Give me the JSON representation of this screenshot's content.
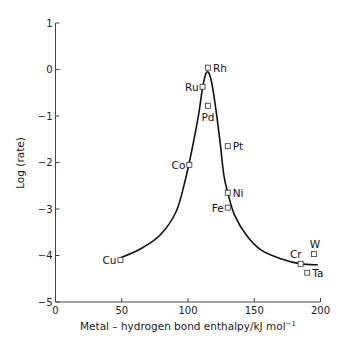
{
  "chart_data": {
    "type": "scatter",
    "title": "",
    "xlabel": "Metal – hydrogen bond enthalpy/kJ mol",
    "xlabel_superscript": "−1",
    "ylabel": "Log (rate)",
    "xlim": [
      0,
      200
    ],
    "ylim": [
      -5,
      1
    ],
    "xticks": [
      0,
      50,
      100,
      150,
      200
    ],
    "yticks": [
      1,
      0,
      -1,
      -2,
      -3,
      -4,
      -5
    ],
    "ytick_labels": [
      "1",
      "0",
      "−1",
      "−2",
      "−3",
      "−4",
      "−5"
    ],
    "grid": false,
    "legend": null,
    "points": [
      {
        "label": "Cu",
        "x": 49,
        "y": -4.1,
        "label_pos": "left"
      },
      {
        "label": "Co",
        "x": 101,
        "y": -2.05,
        "label_pos": "left"
      },
      {
        "label": "Ru",
        "x": 111,
        "y": -0.37,
        "label_pos": "left"
      },
      {
        "label": "Rh",
        "x": 115,
        "y": 0.04,
        "label_pos": "right"
      },
      {
        "label": "Pd",
        "x": 115,
        "y": -0.78,
        "label_pos": "below"
      },
      {
        "label": "Pt",
        "x": 130,
        "y": -1.65,
        "label_pos": "right"
      },
      {
        "label": "Ni",
        "x": 130,
        "y": -2.65,
        "label_pos": "right"
      },
      {
        "label": "Fe",
        "x": 130,
        "y": -2.97,
        "label_pos": "left"
      },
      {
        "label": "Cr",
        "x": 185,
        "y": -4.18,
        "label_pos": "above-left"
      },
      {
        "label": "W",
        "x": 195,
        "y": -3.97,
        "label_pos": "above"
      },
      {
        "label": "Ta",
        "x": 190,
        "y": -4.37,
        "label_pos": "right"
      }
    ],
    "curve": {
      "name": "volcano fit",
      "x": [
        49,
        64,
        79,
        91,
        98,
        103,
        108,
        111,
        114,
        117,
        120,
        124,
        127,
        130,
        135,
        144,
        155,
        170,
        185,
        198
      ],
      "y": [
        -4.05,
        -3.86,
        -3.56,
        -3.06,
        -2.37,
        -1.72,
        -0.97,
        -0.39,
        -0.06,
        -0.17,
        -0.65,
        -1.51,
        -2.26,
        -2.65,
        -3.12,
        -3.56,
        -3.88,
        -4.07,
        -4.18,
        -4.2
      ]
    }
  }
}
